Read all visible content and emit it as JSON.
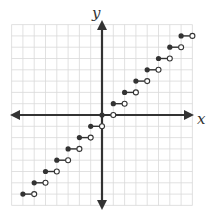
{
  "chart_data": {
    "type": "line",
    "title": "",
    "xlabel": "x",
    "ylabel": "y",
    "xlim": [
      -8,
      8
    ],
    "ylim": [
      -8,
      8
    ],
    "grid": true,
    "tick_labels": false,
    "steps": [
      {
        "x_start": -7,
        "x_end": -6,
        "y": -7
      },
      {
        "x_start": -6,
        "x_end": -5,
        "y": -6
      },
      {
        "x_start": -5,
        "x_end": -4,
        "y": -5
      },
      {
        "x_start": -4,
        "x_end": -3,
        "y": -4
      },
      {
        "x_start": -3,
        "x_end": -2,
        "y": -3
      },
      {
        "x_start": -2,
        "x_end": -1,
        "y": -2
      },
      {
        "x_start": -1,
        "x_end": 0,
        "y": -1
      },
      {
        "x_start": 0,
        "x_end": 1,
        "y": 0
      },
      {
        "x_start": 1,
        "x_end": 2,
        "y": 1
      },
      {
        "x_start": 2,
        "x_end": 3,
        "y": 2
      },
      {
        "x_start": 3,
        "x_end": 4,
        "y": 3
      },
      {
        "x_start": 4,
        "x_end": 5,
        "y": 4
      },
      {
        "x_start": 5,
        "x_end": 6,
        "y": 5
      },
      {
        "x_start": 6,
        "x_end": 7,
        "y": 6
      },
      {
        "x_start": 7,
        "x_end": 8,
        "y": 7
      }
    ],
    "endpoint_style": {
      "left": "closed",
      "right": "open"
    }
  },
  "axes": {
    "x_label": "x",
    "y_label": "y"
  },
  "colors": {
    "axis": "#333333",
    "grid": "#d9d9d9",
    "step": "#333333",
    "open_fill": "#ffffff"
  }
}
